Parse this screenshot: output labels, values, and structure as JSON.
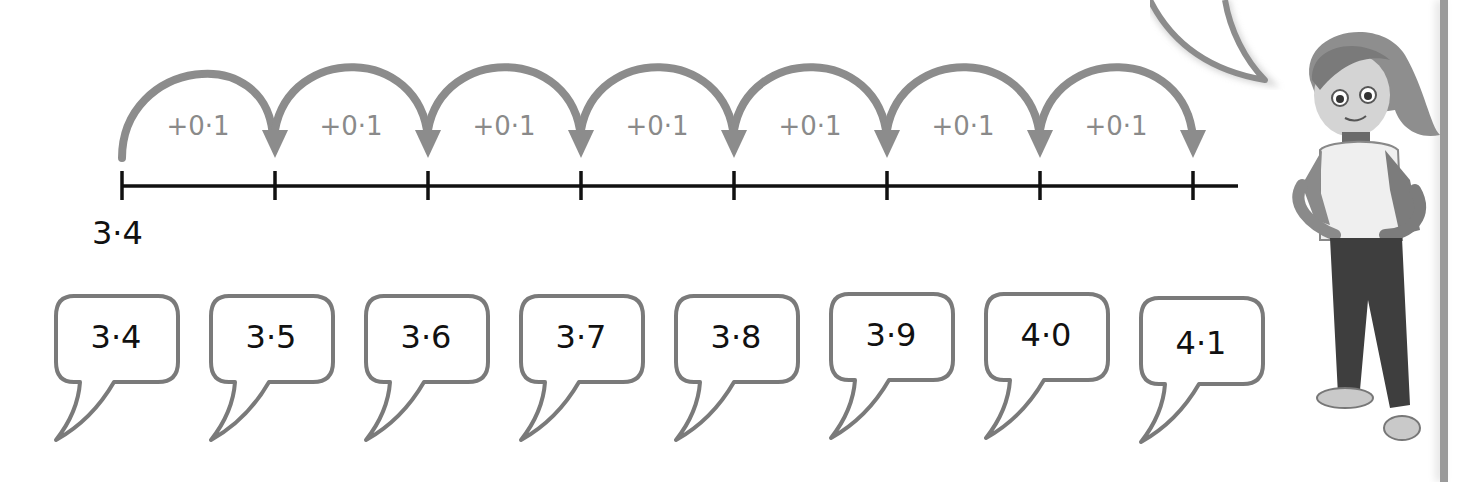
{
  "number_line": {
    "start_label": "3·4",
    "jump_label": "+0·1",
    "jumps": [
      {
        "label": "+0·1"
      },
      {
        "label": "+0·1"
      },
      {
        "label": "+0·1"
      },
      {
        "label": "+0·1"
      },
      {
        "label": "+0·1"
      },
      {
        "label": "+0·1"
      },
      {
        "label": "+0·1"
      }
    ],
    "tick_count": 8,
    "colors": {
      "line": "#111111",
      "arrow": "#8a8a8a",
      "jump_text": "#8a8a8a"
    }
  },
  "speech_bubbles": [
    {
      "value": "3·4"
    },
    {
      "value": "3·5"
    },
    {
      "value": "3·6"
    },
    {
      "value": "3·7"
    },
    {
      "value": "3·8"
    },
    {
      "value": "3·9"
    },
    {
      "value": "4·0"
    },
    {
      "value": "4·1"
    }
  ],
  "character": {
    "description": "cartoon girl with hands on hips, ponytail, jacket and trousers, grayscale"
  },
  "colors": {
    "bubble_border": "#7a7a7a",
    "background": "#ffffff",
    "text": "#111111"
  }
}
